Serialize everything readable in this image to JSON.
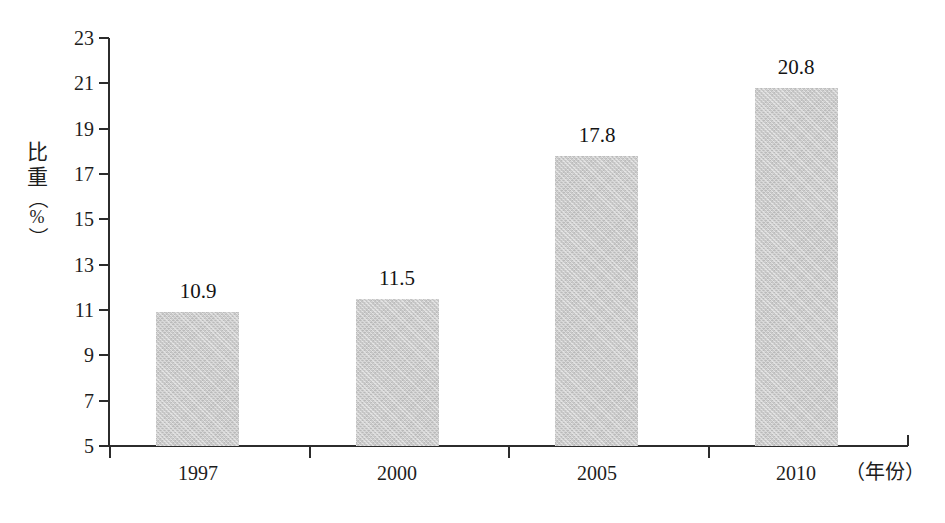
{
  "chart_data": {
    "type": "bar",
    "title": "",
    "subtitle": "",
    "categories": [
      "1997",
      "2000",
      "2005",
      "2010"
    ],
    "values": [
      10.9,
      11.5,
      17.8,
      20.8
    ],
    "data_labels": [
      "10.9",
      "11.5",
      "17.8",
      "20.8"
    ],
    "xlabel": "（年份）",
    "ylabel": "比重（%）",
    "ylabel_chars": [
      "比",
      "重",
      "（",
      "%",
      "）"
    ],
    "ylim": [
      5,
      23
    ],
    "ytick_step": 2,
    "ytick_labels": [
      "23",
      "21",
      "19",
      "17",
      "15",
      "13",
      "11",
      "9",
      "7",
      "5"
    ],
    "ytick_values": [
      23,
      21,
      19,
      17,
      15,
      13,
      11,
      9,
      7,
      5
    ],
    "grid": false,
    "legend": "none",
    "bar_color": "#c9c9c9",
    "axis_color": "#2c2c2c",
    "text_color": "#1d1d1d",
    "background": "#ffffff"
  },
  "axes": {
    "y_title_lines": {
      "c1": "比",
      "c2": "重",
      "open_paren": "（",
      "percent": "%",
      "close_paren": "）"
    },
    "x_title": "（年份）"
  }
}
